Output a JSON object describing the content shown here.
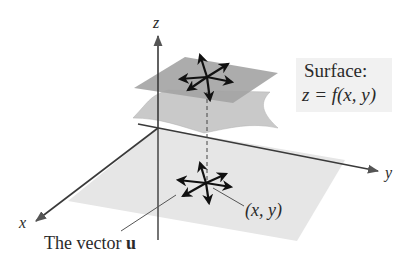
{
  "diagram": {
    "axes": {
      "z_label": "z",
      "y_label": "y",
      "x_label": "x"
    },
    "surface_callout": {
      "title": "Surface:",
      "equation": "z = f(x, y)"
    },
    "point_label": "(x, y)",
    "vector_label_prefix": "The vector ",
    "vector_label_symbol": "u",
    "colors": {
      "plane": "#e6e6e6",
      "upper_tangent_plane": "#9c9c9c",
      "surface": "#c4c4c4",
      "axis": "#444444",
      "arrows": "#111111",
      "callout_bg": "#f1f1f1"
    }
  }
}
